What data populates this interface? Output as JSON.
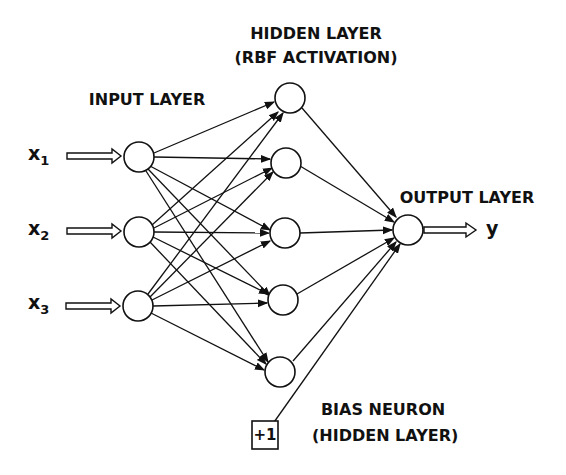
{
  "labels": {
    "hidden_title_1": "HIDDEN LAYER",
    "hidden_title_2": "(RBF ACTIVATION)",
    "input_title": "INPUT LAYER",
    "output_title": "OUTPUT LAYER",
    "bias_title_1": "BIAS NEURON",
    "bias_title_2": "(HIDDEN LAYER)",
    "bias_value": "+1",
    "output_var": "y"
  },
  "inputs": [
    {
      "name": "x",
      "sub": "1"
    },
    {
      "name": "x",
      "sub": "2"
    },
    {
      "name": "x",
      "sub": "3"
    }
  ],
  "colors": {
    "stroke": "#111111",
    "background": "#ffffff"
  }
}
